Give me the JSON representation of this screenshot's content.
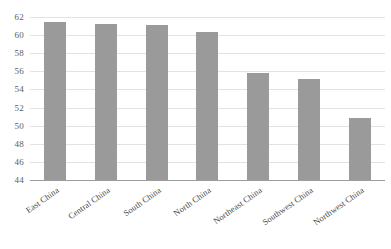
{
  "chart_data": {
    "type": "bar",
    "title": "",
    "subtitle": "",
    "xlabel": "",
    "ylabel": "",
    "categories": [
      "East China",
      "Central China",
      "South China",
      "North China",
      "Northeast China",
      "Southwest China",
      "Northwest China"
    ],
    "values": [
      61.4,
      61.2,
      61.1,
      60.4,
      55.8,
      55.2,
      50.8
    ],
    "ylim": [
      44,
      62
    ],
    "y_ticks": [
      44,
      46,
      48,
      50,
      52,
      54,
      56,
      58,
      60,
      62
    ],
    "y_tick_labels": [
      "44",
      "46",
      "48",
      "50",
      "52",
      "54",
      "56",
      "58",
      "60",
      "62"
    ],
    "grid": true,
    "grid_axis": "y",
    "legend": false,
    "legend_position": "none",
    "series": [
      {
        "name": "Value",
        "color": "#9a9a9a",
        "values": [
          61.4,
          61.2,
          61.1,
          60.4,
          55.8,
          55.2,
          50.8
        ]
      }
    ],
    "annotations": [],
    "colors": {
      "bar": "#9a9a9a",
      "gridline": "#e2e2e2",
      "axis": "#9c9c9c",
      "tick_text": "#5d5d5d",
      "category_text": "#4a4a4a",
      "background": "#ffffff"
    },
    "x_label_rotation_deg": -35
  }
}
